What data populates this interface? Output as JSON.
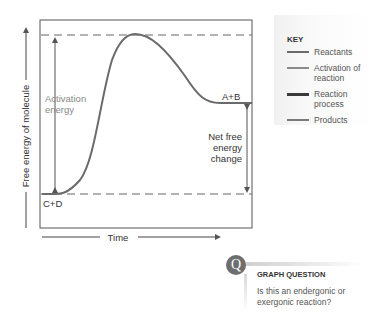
{
  "diagram": {
    "y_axis_label": "Free energy of molecule",
    "x_axis_label": "Time",
    "labels": {
      "activation_energy_line1": "Activation",
      "activation_energy_line2": "energy",
      "products": "A+B",
      "reactants": "C+D",
      "net_change_line1": "Net free",
      "net_change_line2": "energy",
      "net_change_line3": "change"
    },
    "colors": {
      "reactants": "#5a5a5a",
      "activation": "#8a8a8a",
      "reaction_process": "#3a3a3a",
      "products": "#7a7a7a",
      "curve": "#6a6a6a"
    }
  },
  "key": {
    "title": "KEY",
    "items": [
      {
        "label": "Reactants",
        "color": "#6a6a6a"
      },
      {
        "label": "Activation of reaction",
        "color": "#8a8a8a"
      },
      {
        "label": "Reaction process",
        "color": "#3a3a3a"
      },
      {
        "label": "Products",
        "color": "#7a7a7a"
      }
    ]
  },
  "question": {
    "badge": "Q",
    "title": "GRAPH QUESTION",
    "text": "Is this an endergonic or exergonic reaction?"
  }
}
